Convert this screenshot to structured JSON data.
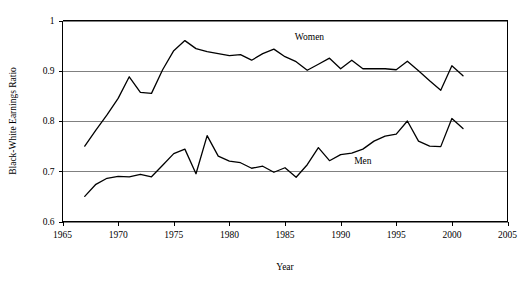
{
  "chart_data": {
    "type": "line",
    "title": "",
    "xlabel": "Year",
    "ylabel": "Black-White Earnings Ratio",
    "xlim": [
      1965,
      2005
    ],
    "ylim": [
      0.6,
      1.0
    ],
    "xticks": [
      1965,
      1970,
      1975,
      1980,
      1985,
      1990,
      1995,
      2000,
      2005
    ],
    "yticks": [
      0.6,
      0.7,
      0.8,
      0.9,
      1
    ],
    "xtick_labels": [
      "1965",
      "1970",
      "1975",
      "1980",
      "1985",
      "1990",
      "1995",
      "2000",
      "2005"
    ],
    "ytick_labels": [
      "0.6",
      "0.7",
      "0.8",
      "0.9",
      "1"
    ],
    "grid": true,
    "grid_axis": "y",
    "legend": "inline-annotations",
    "x": [
      1967,
      1968,
      1969,
      1970,
      1971,
      1972,
      1973,
      1974,
      1975,
      1976,
      1977,
      1978,
      1979,
      1980,
      1981,
      1982,
      1983,
      1984,
      1985,
      1986,
      1987,
      1988,
      1989,
      1990,
      1991,
      1992,
      1993,
      1994,
      1995,
      1996,
      1997,
      1998,
      1999,
      2000,
      2001
    ],
    "series": [
      {
        "name": "Women",
        "label": "Women",
        "color": "#000000",
        "values": [
          0.75,
          0.782,
          0.812,
          0.845,
          0.888,
          0.857,
          0.855,
          0.902,
          0.94,
          0.96,
          0.944,
          0.938,
          0.934,
          0.93,
          0.932,
          0.921,
          0.934,
          0.943,
          0.928,
          0.918,
          0.901,
          0.913,
          0.925,
          0.904,
          0.921,
          0.904,
          0.904,
          0.904,
          0.902,
          0.919,
          0.9,
          0.88,
          0.861,
          0.91,
          0.89
        ]
      },
      {
        "name": "Men",
        "label": "Men",
        "color": "#000000",
        "values": [
          0.65,
          0.674,
          0.686,
          0.69,
          0.689,
          0.694,
          0.689,
          0.712,
          0.735,
          0.744,
          0.695,
          0.771,
          0.73,
          0.72,
          0.717,
          0.706,
          0.71,
          0.698,
          0.707,
          0.688,
          0.713,
          0.747,
          0.721,
          0.733,
          0.736,
          0.744,
          0.76,
          0.77,
          0.774,
          0.8,
          0.76,
          0.75,
          0.749,
          0.805,
          0.785
        ]
      }
    ],
    "annotations": [
      {
        "text": "Women",
        "x": 1987.2,
        "y": 0.968
      },
      {
        "text": "Men",
        "x": 1992.0,
        "y": 0.722
      }
    ]
  }
}
